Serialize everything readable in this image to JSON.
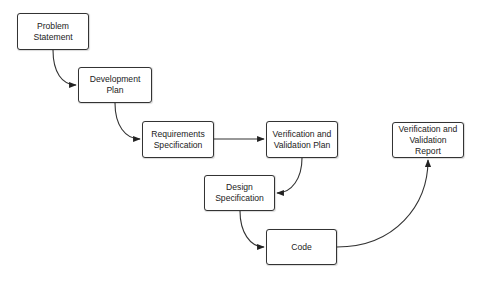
{
  "diagram": {
    "title": "",
    "colors": {
      "stroke": "#333333",
      "fill": "#ffffff",
      "text": "#222222"
    },
    "nodes": [
      {
        "id": "problem",
        "label": "Problem\nStatement",
        "x": 17,
        "y": 13,
        "w": 72,
        "h": 37
      },
      {
        "id": "devplan",
        "label": "Development Plan",
        "x": 78,
        "y": 67,
        "w": 74,
        "h": 36
      },
      {
        "id": "reqspec",
        "label": "Requirements\nSpecification",
        "x": 142,
        "y": 121,
        "w": 72,
        "h": 37
      },
      {
        "id": "vvplan",
        "label": "Verification and\nValidation Plan",
        "x": 266,
        "y": 121,
        "w": 72,
        "h": 37
      },
      {
        "id": "designspec",
        "label": "Design\nSpecification",
        "x": 204,
        "y": 175,
        "w": 71,
        "h": 36
      },
      {
        "id": "code",
        "label": "Code",
        "x": 266,
        "y": 229,
        "w": 71,
        "h": 36
      },
      {
        "id": "vvreport",
        "label": "Verification and\nValidation Report",
        "x": 392,
        "y": 122,
        "w": 72,
        "h": 36
      }
    ],
    "edges": [
      {
        "from": "problem",
        "to": "devplan",
        "path": "M53,50 C53,72 62,85 76,85"
      },
      {
        "from": "devplan",
        "to": "reqspec",
        "path": "M115,103 C115,125 125,139 140,139"
      },
      {
        "from": "reqspec",
        "to": "vvplan",
        "path": "M214,139 L264,139"
      },
      {
        "from": "vvplan",
        "to": "designspec",
        "path": "M302,158 C302,178 292,193 277,193"
      },
      {
        "from": "designspec",
        "to": "code",
        "path": "M240,211 C240,232 250,247 264,247"
      },
      {
        "from": "code",
        "to": "vvreport",
        "path": "M337,247 C395,247 428,205 428,160"
      }
    ]
  }
}
